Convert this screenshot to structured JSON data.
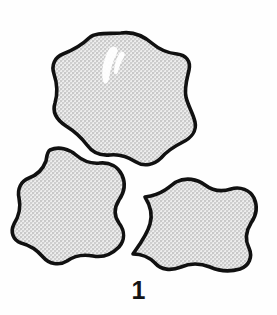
{
  "figure": {
    "caption": "1",
    "background_color": "#fefefe",
    "outline_color": "#111111",
    "fill_color": "#d9d9d9",
    "fill_texture": "stipple-halftone-gray",
    "canvas": {
      "width": 277,
      "height": 315
    },
    "specimens": [
      {
        "id": "specimen-top",
        "label": "upper specimen",
        "bbox": {
          "x": 52,
          "y": 31,
          "width": 144,
          "height": 135
        },
        "has_highlight": true,
        "path": "M 121 33 C 134 31 145 37 153 44 C 160 50 168 53 177 54 C 186 55 191 61 189 70 C 187 79 184 88 186 97 C 188 106 193 113 195 122 C 197 131 191 138 183 142 C 175 146 167 151 161 158 C 154 165 144 167 136 162 C 128 157 119 154 110 155 C 100 156 92 152 87 145 C 81 137 74 131 66 126 C 57 120 52 112 55 103 C 58 93 57 83 54 74 C 51 65 55 57 63 54 C 73 50 82 45 89 38 C 96 32 108 34 121 33 Z"
      },
      {
        "id": "specimen-lower-left",
        "label": "lower-left specimen",
        "bbox": {
          "x": 19,
          "y": 146,
          "width": 113,
          "height": 112
        },
        "has_highlight": false,
        "path": "M 50 150 C 59 146 69 149 76 155 C 83 161 91 164 100 163 C 110 162 118 167 122 175 C 126 184 124 193 119 200 C 114 208 114 216 119 223 C 125 231 125 240 119 247 C 112 254 103 258 93 256 C 83 254 74 256 67 261 C 59 266 49 264 43 257 C 37 250 29 245 21 243 C 13 240 10 232 14 224 C 19 216 21 207 19 198 C 17 189 21 181 29 178 C 37 175 43 169 46 161 C 47 156 47 152 50 150 Z"
      },
      {
        "id": "specimen-lower-right",
        "label": "lower-right specimen",
        "bbox": {
          "x": 134,
          "y": 176,
          "width": 124,
          "height": 96
        },
        "has_highlight": false,
        "path": "M 176 182 C 186 177 197 179 205 185 C 213 191 222 192 231 189 C 240 186 250 190 254 198 C 258 207 256 216 251 223 C 246 231 245 240 249 248 C 253 257 249 266 240 269 C 230 272 219 271 210 267 C 200 263 190 263 181 267 C 171 271 161 270 155 263 C 149 257 141 254 133 254 C 140 244 147 235 150 224 C 153 214 150 205 145 197 C 152 196 159 194 165 190 C 170 187 173 184 176 182 Z"
      }
    ]
  }
}
